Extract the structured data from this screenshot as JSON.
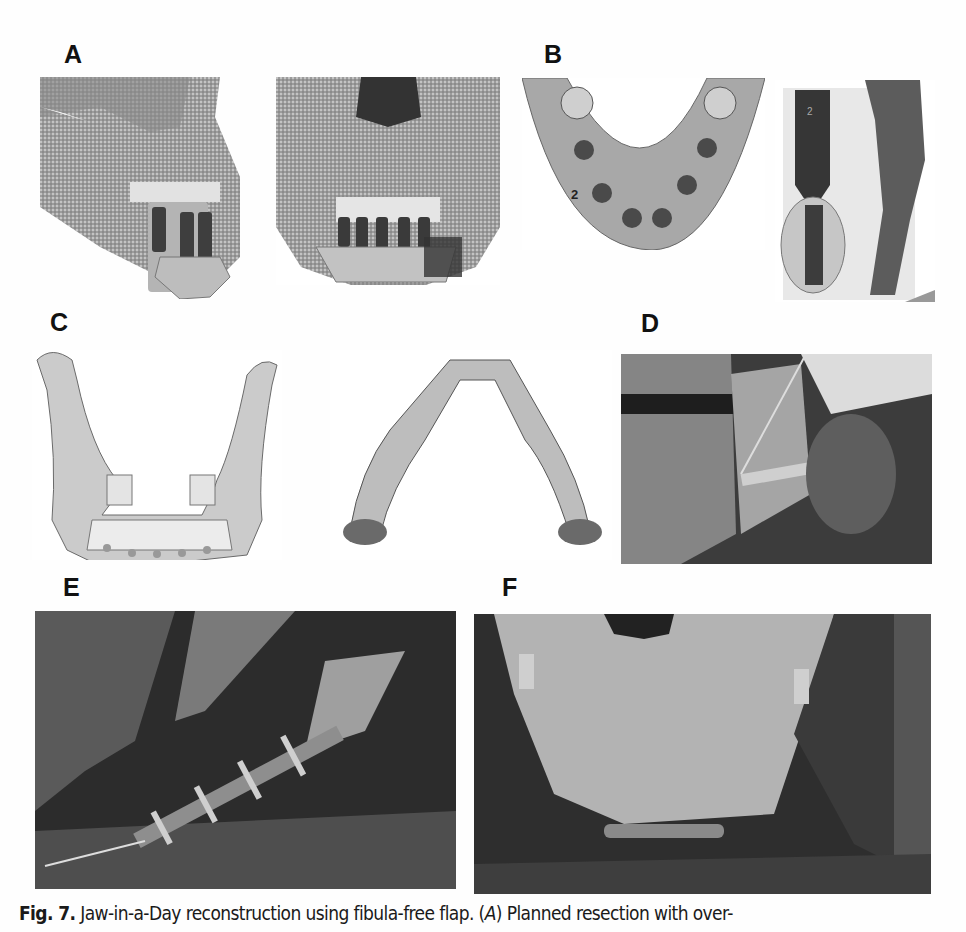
{
  "figure": {
    "panels": [
      {
        "id": "A",
        "label": "A",
        "description": "3D CT rendering of skull showing planned resection with overlay of implants — lateral and frontal views"
      },
      {
        "id": "B",
        "label": "B",
        "description": "Occlusal view of mandible with planned implant positions and cross-section of implant in fibula",
        "annotations": [
          "2",
          "2"
        ]
      },
      {
        "id": "C",
        "label": "C",
        "description": "3D models of reconstructed mandible with fibula segments and reconstruction plate"
      },
      {
        "id": "D",
        "label": "D",
        "description": "Intraoperative photograph of fibula segment with cutting guide"
      },
      {
        "id": "E",
        "label": "E",
        "description": "Intraoperative photograph of fibula flap with plate and dental implants"
      },
      {
        "id": "F",
        "label": "F",
        "description": "Intraoperative photograph of inset fibula flap with reconstruction plate, frontal view"
      }
    ],
    "caption": {
      "fig_label": "Fig. 7.",
      "text_before": " Jaw-in-a-Day reconstruction using fibula-free flap. (",
      "italic_ref": "A",
      "text_after": ") Planned resection with over-"
    }
  }
}
